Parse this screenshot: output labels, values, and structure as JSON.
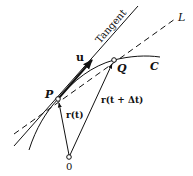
{
  "diagram": {
    "labels": {
      "tangent": "Tangent",
      "line_L": "L",
      "curve_C": "C",
      "point_P": "P",
      "point_Q": "Q",
      "origin": "0",
      "vector_u": "u",
      "vector_rt": "r(t)",
      "vector_rtdt": "r(t + Δt)"
    },
    "colors": {
      "ink": "#111111",
      "background": "#ffffff"
    }
  }
}
